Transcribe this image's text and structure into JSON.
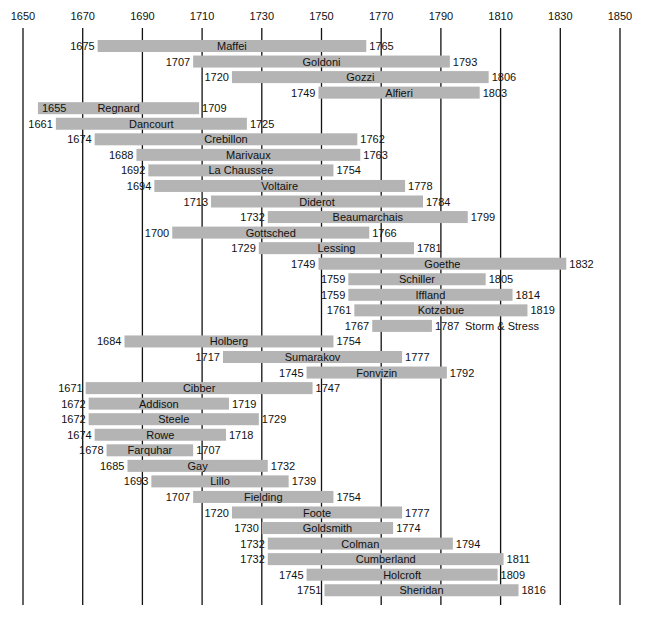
{
  "chart_data": {
    "type": "timeline",
    "title": "",
    "xlabel": "",
    "ylabel": "",
    "x_range": [
      1650,
      1850
    ],
    "x_ticks": [
      1650,
      1670,
      1690,
      1710,
      1730,
      1750,
      1770,
      1790,
      1810,
      1830,
      1850
    ],
    "grid": "vertical",
    "colors": {
      "bar": "#b4b4b4",
      "grid": "#111111",
      "text": "#111111"
    },
    "rows": [
      {
        "name": "Maffei",
        "start": 1675,
        "end": 1765
      },
      {
        "name": "Goldoni",
        "start": 1707,
        "end": 1793
      },
      {
        "name": "Gozzi",
        "start": 1720,
        "end": 1806
      },
      {
        "name": "Alfieri",
        "start": 1749,
        "end": 1803
      },
      {
        "name": "Regnard",
        "start": 1655,
        "end": 1709,
        "start_inside": true
      },
      {
        "name": "Dancourt",
        "start": 1661,
        "end": 1725
      },
      {
        "name": "Crebillon",
        "start": 1674,
        "end": 1762
      },
      {
        "name": "Marivaux",
        "start": 1688,
        "end": 1763
      },
      {
        "name": "La Chaussee",
        "start": 1692,
        "end": 1754
      },
      {
        "name": "Voltaire",
        "start": 1694,
        "end": 1778
      },
      {
        "name": "Diderot",
        "start": 1713,
        "end": 1784
      },
      {
        "name": "Beaumarchais",
        "start": 1732,
        "end": 1799
      },
      {
        "name": "Gottsched",
        "start": 1700,
        "end": 1766
      },
      {
        "name": "Lessing",
        "start": 1729,
        "end": 1781
      },
      {
        "name": "Goethe",
        "start": 1749,
        "end": 1832
      },
      {
        "name": "Schiller",
        "start": 1759,
        "end": 1805
      },
      {
        "name": "Iffland",
        "start": 1759,
        "end": 1814
      },
      {
        "name": "Kotzebue",
        "start": 1761,
        "end": 1819
      },
      {
        "name": "",
        "start": 1767,
        "end": 1787,
        "note": "Storm & Stress"
      },
      {
        "name": "Holberg",
        "start": 1684,
        "end": 1754
      },
      {
        "name": "Sumarakov",
        "start": 1717,
        "end": 1777
      },
      {
        "name": "Fonvizin",
        "start": 1745,
        "end": 1792
      },
      {
        "name": "Cibber",
        "start": 1671,
        "end": 1747
      },
      {
        "name": "Addison",
        "start": 1672,
        "end": 1719
      },
      {
        "name": "Steele",
        "start": 1672,
        "end": 1729
      },
      {
        "name": "Rowe",
        "start": 1674,
        "end": 1718
      },
      {
        "name": "Farquhar",
        "start": 1678,
        "end": 1707
      },
      {
        "name": "Gay",
        "start": 1685,
        "end": 1732
      },
      {
        "name": "Lillo",
        "start": 1693,
        "end": 1739
      },
      {
        "name": "Fielding",
        "start": 1707,
        "end": 1754
      },
      {
        "name": "Foote",
        "start": 1720,
        "end": 1777
      },
      {
        "name": "Goldsmith",
        "start": 1730,
        "end": 1774
      },
      {
        "name": "Colman",
        "start": 1732,
        "end": 1794
      },
      {
        "name": "Cumberland",
        "start": 1732,
        "end": 1811
      },
      {
        "name": "Holcroft",
        "start": 1745,
        "end": 1809
      },
      {
        "name": "Sheridan",
        "start": 1751,
        "end": 1816
      }
    ]
  }
}
